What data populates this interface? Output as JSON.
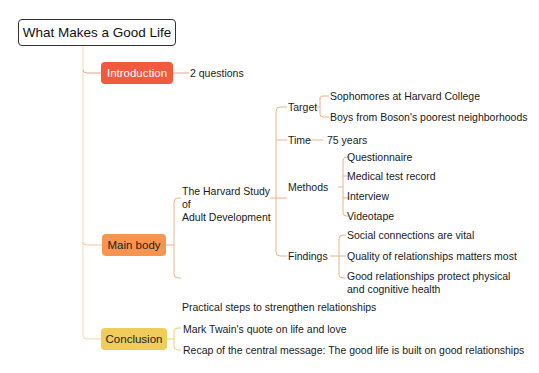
{
  "root": {
    "label": "What Makes a Good Life"
  },
  "colors": {
    "introduction": "#f15a3c",
    "main_body": "#f7944f",
    "conclusion": "#f0cc5a",
    "connector": "#e8b48c"
  },
  "branches": {
    "introduction": {
      "label": "Introduction",
      "children": [
        "2 questions"
      ]
    },
    "main_body": {
      "label": "Main body",
      "study": {
        "label_line1": "The Harvard Study of",
        "label_line2": "Adult Development",
        "target": {
          "label": "Target",
          "children": [
            "Sophomores at Harvard College",
            "Boys from Boson's poorest neighborhoods"
          ]
        },
        "time": {
          "label": "Time",
          "children": [
            "75 years"
          ]
        },
        "methods": {
          "label": "Methods",
          "children": [
            "Questionnaire",
            "Medical test record",
            "Interview",
            "Videotape"
          ]
        },
        "findings": {
          "label": "Findings",
          "children": [
            "Social connections are vital",
            "Quality of relationships matters most",
            "Good relationships protect physical",
            "and cognitive health"
          ]
        }
      },
      "practical": "Practical steps to strengthen relationships"
    },
    "conclusion": {
      "label": "Conclusion",
      "children": [
        "Mark Twain's quote on life and love",
        "Recap of the central message: The good life is built on good relationships"
      ]
    }
  }
}
